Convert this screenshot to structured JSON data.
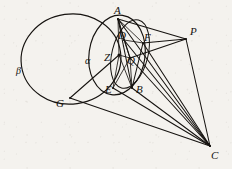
{
  "figure": {
    "kind": "geometry-diagram",
    "caption": "",
    "background_color": "#f4f2ee",
    "ink_color": "#15120f",
    "width": 232,
    "height": 169,
    "points": [
      {
        "id": "A",
        "label": "A",
        "x": 118,
        "y": 19,
        "label_x": 114,
        "label_y": 5
      },
      {
        "id": "D",
        "label": "D",
        "x": 124,
        "y": 40,
        "label_x": 118,
        "label_y": 30
      },
      {
        "id": "F",
        "label": "F",
        "x": 143,
        "y": 43,
        "label_x": 144,
        "label_y": 32
      },
      {
        "id": "P",
        "label": "P",
        "x": 186,
        "y": 39,
        "label_x": 190,
        "label_y": 26
      },
      {
        "id": "Z",
        "label": "Z",
        "x": 119,
        "y": 55,
        "label_x": 104,
        "label_y": 52
      },
      {
        "id": "Q",
        "label": "Q",
        "x": 130,
        "y": 58,
        "label_x": 127,
        "label_y": 55
      },
      {
        "id": "E",
        "label": "E",
        "x": 113,
        "y": 88,
        "label_x": 105,
        "label_y": 84
      },
      {
        "id": "B",
        "label": "B",
        "x": 132,
        "y": 88,
        "label_x": 136,
        "label_y": 84
      },
      {
        "id": "G",
        "label": "G",
        "x": 70,
        "y": 98,
        "label_x": 56,
        "label_y": 98
      },
      {
        "id": "C",
        "label": "C",
        "x": 210,
        "y": 146,
        "label_x": 211,
        "label_y": 150
      }
    ],
    "curve_labels": [
      {
        "id": "alpha",
        "label": "α",
        "x": 85,
        "y": 56
      },
      {
        "id": "beta",
        "label": "β",
        "x": 16,
        "y": 66
      }
    ],
    "curves": [
      {
        "id": "beta-circle",
        "name": "large-circle-beta",
        "type": "ellipse",
        "cx": 71,
        "cy": 59,
        "rx": 50,
        "ry": 45,
        "rotation": -8
      },
      {
        "id": "alpha-circle",
        "name": "circle-alpha",
        "type": "ellipse",
        "cx": 117,
        "cy": 55,
        "rx": 28,
        "ry": 40,
        "rotation": 8
      },
      {
        "id": "inner-circle",
        "name": "small-inner-circle",
        "type": "ellipse",
        "cx": 130,
        "cy": 54,
        "rx": 18,
        "ry": 35,
        "rotation": 14
      }
    ],
    "segments": [
      {
        "from": "A",
        "to": "P"
      },
      {
        "from": "A",
        "to": "F"
      },
      {
        "from": "A",
        "to": "D"
      },
      {
        "from": "A",
        "to": "Q"
      },
      {
        "from": "A",
        "to": "Z"
      },
      {
        "from": "A",
        "to": "C"
      },
      {
        "from": "A",
        "to": "B"
      },
      {
        "from": "D",
        "to": "F"
      },
      {
        "from": "D",
        "to": "Q"
      },
      {
        "from": "D",
        "to": "C"
      },
      {
        "from": "F",
        "to": "P"
      },
      {
        "from": "F",
        "to": "C"
      },
      {
        "from": "F",
        "to": "B"
      },
      {
        "from": "P",
        "to": "C"
      },
      {
        "from": "P",
        "to": "Q"
      },
      {
        "from": "Z",
        "to": "Q"
      },
      {
        "from": "Z",
        "to": "E"
      },
      {
        "from": "Z",
        "to": "B"
      },
      {
        "from": "Z",
        "to": "G"
      },
      {
        "from": "Q",
        "to": "E"
      },
      {
        "from": "Q",
        "to": "B"
      },
      {
        "from": "Q",
        "to": "C"
      },
      {
        "from": "E",
        "to": "C"
      },
      {
        "from": "B",
        "to": "C"
      },
      {
        "from": "G",
        "to": "C"
      }
    ]
  }
}
